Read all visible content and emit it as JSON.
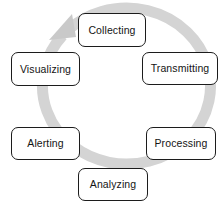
{
  "diagram": {
    "type": "cycle",
    "direction": "clockwise",
    "ring": {
      "color": "#d4d4d4",
      "arrowhead_color": "#c9c9c9",
      "arrowhead_position": "top-left",
      "shape_name": "circular-arrow"
    },
    "background_color": "#ffffff",
    "node_border_color": "#1c1c1c",
    "node_fill_color": "#ffffff",
    "node_text_color": "#141414",
    "stages": [
      {
        "id": "collecting",
        "label": "Collecting",
        "position": "top"
      },
      {
        "id": "transmitting",
        "label": "Transmitting",
        "position": "upper-right"
      },
      {
        "id": "processing",
        "label": "Processing",
        "position": "lower-right"
      },
      {
        "id": "analyzing",
        "label": "Analyzing",
        "position": "bottom"
      },
      {
        "id": "alerting",
        "label": "Alerting",
        "position": "lower-left"
      },
      {
        "id": "visualizing",
        "label": "Visualizing",
        "position": "upper-left"
      }
    ]
  }
}
